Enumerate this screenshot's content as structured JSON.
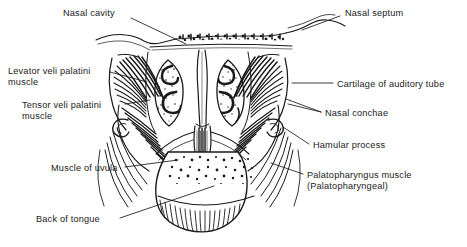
{
  "figure": {
    "kind": "anatomical-illustration",
    "background_color": "#ffffff",
    "ink_color": "#1a1a1a",
    "width": 467,
    "height": 247
  },
  "labels": [
    {
      "id": "nasal-cavity",
      "text": "Nasal cavity",
      "side": "left",
      "x": 63,
      "y": 8,
      "leader": [
        [
          131,
          18
        ],
        [
          186,
          44
        ]
      ]
    },
    {
      "id": "nasal-septum",
      "text": "Nasal septum",
      "side": "right",
      "x": 345,
      "y": 8,
      "leader": [
        [
          340,
          16
        ],
        [
          302,
          30
        ]
      ]
    },
    {
      "id": "levator-veli-palatini-muscle",
      "text": "Levator veli palatini\nmuscle",
      "line1": "Levator veli palatini",
      "line2": "muscle",
      "side": "left",
      "x": 8,
      "y": 66,
      "leader": [
        [
          110,
          72
        ],
        [
          147,
          82
        ]
      ]
    },
    {
      "id": "cartilage-of-auditory-tube",
      "text": "Cartilage of auditory tube",
      "side": "right",
      "x": 337,
      "y": 79,
      "leader": [
        [
          333,
          83
        ],
        [
          292,
          83
        ]
      ]
    },
    {
      "id": "tensor-veli-palatini-muscle",
      "text": "Tensor veli palatini\nmuscle",
      "line1": "Tensor veli palatini",
      "line2": "muscle",
      "side": "left",
      "x": 22,
      "y": 100,
      "leader": [
        [
          125,
          104
        ],
        [
          150,
          100
        ]
      ]
    },
    {
      "id": "nasal-conchae",
      "text": "Nasal conchae",
      "side": "right",
      "x": 325,
      "y": 108,
      "leader": [
        [
          321,
          112
        ],
        [
          286,
          99
        ]
      ]
    },
    {
      "id": "hamular-process",
      "text": "Hamular process",
      "side": "right",
      "x": 313,
      "y": 140,
      "leader": [
        [
          309,
          144
        ],
        [
          283,
          127
        ]
      ]
    },
    {
      "id": "muscle-of-uvula",
      "text": "Muscle of uvula",
      "side": "left",
      "x": 51,
      "y": 163,
      "leader": [
        [
          125,
          167
        ],
        [
          178,
          160
        ]
      ]
    },
    {
      "id": "palatopharyngus-muscle",
      "text": "Palatopharyngus muscle\n(Palatopharyngeal)",
      "line1": "Palatopharyngus muscle",
      "line2": "(Palatopharyngeal)",
      "side": "right",
      "x": 307,
      "y": 170,
      "leader": [
        [
          303,
          174
        ],
        [
          271,
          163
        ]
      ]
    },
    {
      "id": "back-of-tongue",
      "text": "Back of tongue",
      "side": "left",
      "x": 36,
      "y": 214,
      "leader": [
        [
          120,
          218
        ],
        [
          214,
          186
        ]
      ]
    }
  ]
}
